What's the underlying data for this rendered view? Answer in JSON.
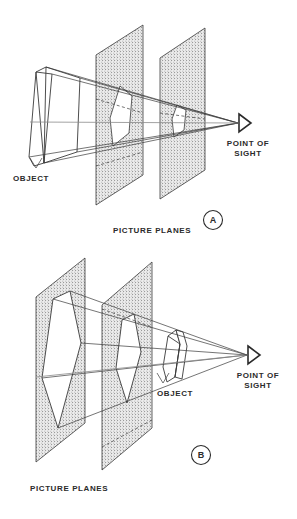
{
  "figure": {
    "background_color": "#ffffff",
    "ink_color": "#2b2b2b",
    "plane_fill_color": "#b9b9b9"
  },
  "panels": [
    {
      "id": "A",
      "marker_label": "A",
      "marker_name": "panel-marker-a",
      "labels": {
        "object": "OBJECT",
        "picture_planes": "PICTURE PLANES",
        "point_of_sight_line1": "POINT OF",
        "point_of_sight_line2": "SIGHT"
      },
      "description": "Object at left, two picture planes between object and point of sight; projections shrink toward the eye.",
      "plane_count": 2,
      "eye_icon": "eye-triangle-icon"
    },
    {
      "id": "B",
      "marker_label": "B",
      "marker_name": "panel-marker-b",
      "labels": {
        "object": "OBJECT",
        "picture_planes": "PICTURE PLANES",
        "point_of_sight_line1": "POINT OF",
        "point_of_sight_line2": "SIGHT"
      },
      "description": "Small object near the point of sight, two picture planes farther away; projections enlarge away from the eye.",
      "plane_count": 2,
      "eye_icon": "eye-triangle-icon"
    }
  ]
}
